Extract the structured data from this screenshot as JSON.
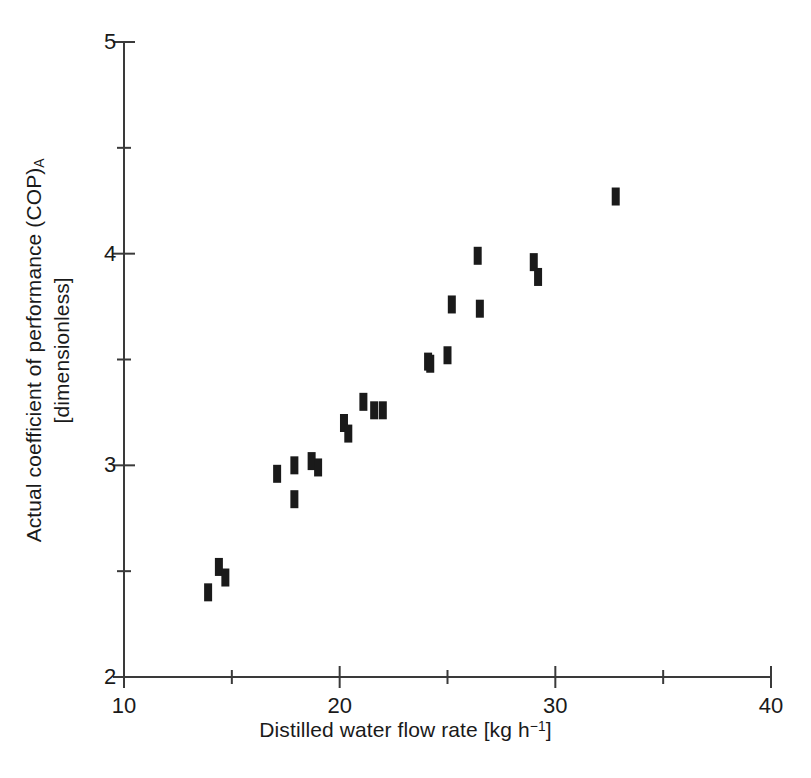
{
  "chart_data": {
    "type": "scatter",
    "title": "",
    "xlabel": "Distilled water flow rate [kg h−1]",
    "xlabel_text": "Distilled water flow rate [kg h",
    "xlabel_exponent": "−1",
    "xlabel_tail": "]",
    "ylabel_line1_text": "Actual coefficient of performance (COP)",
    "ylabel_line1_sub": "A",
    "ylabel_line2": "[dimensionless]",
    "ylabel": "Actual coefficient of performance (COP)A [dimensionless]",
    "xlim": [
      10,
      40
    ],
    "ylim": [
      2,
      5
    ],
    "xticks": [
      10,
      20,
      30,
      40
    ],
    "xtick_labels": [
      "10",
      "20",
      "30",
      "40"
    ],
    "xminorticks": [
      15,
      25,
      35
    ],
    "yticks": [
      2,
      3,
      4,
      5
    ],
    "ytick_labels": [
      "2",
      "3",
      "4",
      "5"
    ],
    "yminorticks": [
      2.5,
      3.5,
      4.5
    ],
    "grid": false,
    "legend": false,
    "marker": "filled-rectangle",
    "marker_color": "#1a1a1a",
    "series": [
      {
        "name": "Actual COP vs distilled water flow rate",
        "points": [
          [
            13.9,
            2.4
          ],
          [
            14.4,
            2.52
          ],
          [
            14.7,
            2.47
          ],
          [
            17.1,
            2.96
          ],
          [
            17.9,
            3.0
          ],
          [
            17.9,
            2.84
          ],
          [
            18.7,
            3.02
          ],
          [
            19.0,
            2.99
          ],
          [
            20.2,
            3.2
          ],
          [
            20.4,
            3.15
          ],
          [
            21.1,
            3.3
          ],
          [
            21.6,
            3.26
          ],
          [
            22.0,
            3.26
          ],
          [
            24.1,
            3.49
          ],
          [
            24.2,
            3.48
          ],
          [
            25.0,
            3.52
          ],
          [
            25.2,
            3.76
          ],
          [
            26.4,
            3.99
          ],
          [
            26.5,
            3.74
          ],
          [
            29.0,
            3.96
          ],
          [
            29.2,
            3.89
          ],
          [
            32.8,
            4.27
          ]
        ]
      }
    ]
  }
}
